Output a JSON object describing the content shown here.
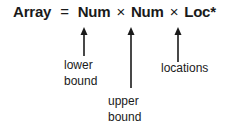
{
  "equation": {
    "lhs": "Array",
    "equals": "=",
    "terms": [
      "Num",
      "Num",
      "Loc*"
    ],
    "operator": "×"
  },
  "annotations": [
    {
      "target": "Num",
      "label": "lower bound"
    },
    {
      "target": "Num",
      "label": "upper bound"
    },
    {
      "target": "Loc*",
      "label": "locations"
    }
  ],
  "colors": {
    "ink": "#1a1a1a",
    "background": "#ffffff"
  }
}
